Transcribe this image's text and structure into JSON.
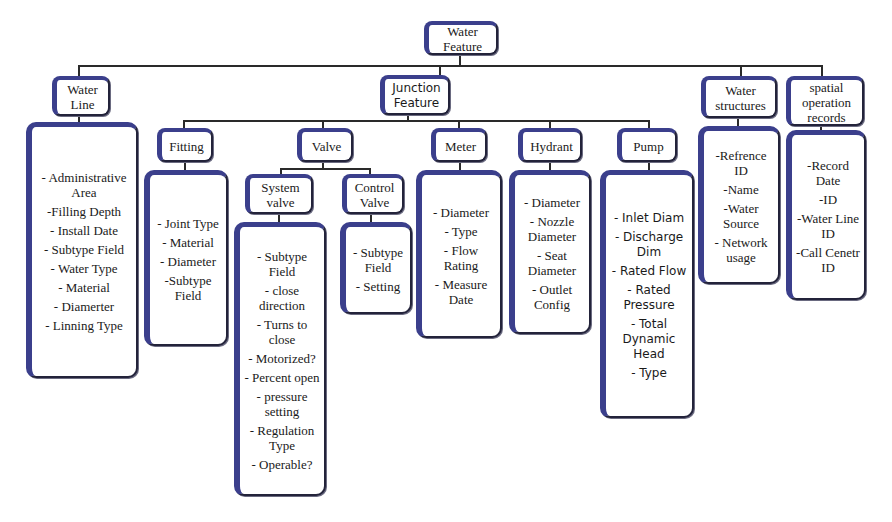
{
  "diagram": {
    "root": {
      "label": "Water Feature"
    },
    "level1": [
      {
        "id": "water-line",
        "label": "Water Line",
        "attributes": [
          "- Administrative Area",
          "-Filling Depth",
          "- Install Date",
          "- Subtype Field",
          "- Water Type",
          "- Material",
          "- Diamerter",
          "- Linning Type"
        ]
      },
      {
        "id": "junction-feature",
        "label": "Junction Feature"
      },
      {
        "id": "water-structures",
        "label": "Water structures",
        "attributes": [
          "-Refrence ID",
          "-Name",
          "-Water Source",
          "- Network usage"
        ]
      },
      {
        "id": "spatial-operation-records",
        "label": "spatial operation records",
        "attributes": [
          "-Record Date",
          "-ID",
          "-Water Line ID",
          "-Call Cenetr ID"
        ]
      }
    ],
    "junction_children": [
      {
        "id": "fitting",
        "label": "Fitting",
        "attributes": [
          "- Joint Type",
          "- Material",
          "- Diameter",
          "-Subtype Field"
        ]
      },
      {
        "id": "valve",
        "label": "Valve"
      },
      {
        "id": "meter",
        "label": "Meter",
        "attributes": [
          "- Diameter",
          "- Type",
          "- Flow Rating",
          "- Measure Date"
        ]
      },
      {
        "id": "hydrant",
        "label": "Hydrant",
        "attributes": [
          "- Diameter",
          "- Nozzle Diameter",
          "- Seat Diameter",
          "- Outlet Config"
        ]
      },
      {
        "id": "pump",
        "label": "Pump",
        "attributes": [
          "- Inlet Diam",
          "- Discharge Dim",
          "- Rated Flow",
          "- Rated Pressure",
          "- Total Dynamic Head",
          "- Type"
        ]
      }
    ],
    "valve_children": [
      {
        "id": "system-valve",
        "label": "System valve",
        "attributes": [
          "- Subtype Field",
          "- close direction",
          "- Turns to close",
          "- Motorized?",
          "- Percent open",
          "- pressure setting",
          "- Regulation Type",
          "- Operable?"
        ]
      },
      {
        "id": "control-valve",
        "label": "Control Valve",
        "attributes": [
          "- Subtype Field",
          "- Setting"
        ]
      }
    ]
  }
}
